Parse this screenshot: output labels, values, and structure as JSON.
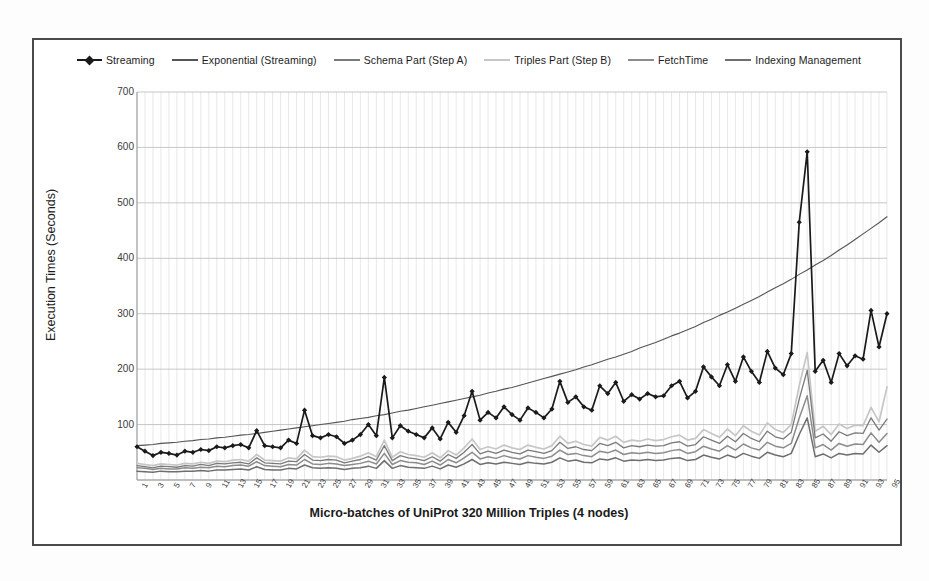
{
  "chart_data": {
    "type": "line",
    "title": "",
    "xlabel": "Micro-batches of UniProt 320 Million Triples (4 nodes)",
    "ylabel": "Execution Times (Seconds)",
    "ylim": [
      0,
      700
    ],
    "ytick_values": [
      0,
      100,
      200,
      300,
      400,
      500,
      600,
      700
    ],
    "ytick_labels": [
      "",
      "100",
      "200",
      "300",
      "400",
      "500",
      "600",
      "700"
    ],
    "xlim": [
      1,
      95
    ],
    "xtick_labels": [
      "1",
      "3",
      "5",
      "7",
      "9",
      "11",
      "13",
      "15",
      "17",
      "19",
      "21",
      "23",
      "25",
      "27",
      "29",
      "31",
      "33",
      "35",
      "37",
      "39",
      "41",
      "43",
      "45",
      "47",
      "49",
      "51",
      "53",
      "55",
      "57",
      "59",
      "61",
      "63",
      "65",
      "67",
      "69",
      "71",
      "73",
      "75",
      "77",
      "79",
      "81",
      "83",
      "85",
      "87",
      "89",
      "91",
      "93",
      "95"
    ],
    "grid": true,
    "legend_position": "top-center",
    "x": [
      1,
      2,
      3,
      4,
      5,
      6,
      7,
      8,
      9,
      10,
      11,
      12,
      13,
      14,
      15,
      16,
      17,
      18,
      19,
      20,
      21,
      22,
      23,
      24,
      25,
      26,
      27,
      28,
      29,
      30,
      31,
      32,
      33,
      34,
      35,
      36,
      37,
      38,
      39,
      40,
      41,
      42,
      43,
      44,
      45,
      46,
      47,
      48,
      49,
      50,
      51,
      52,
      53,
      54,
      55,
      56,
      57,
      58,
      59,
      60,
      61,
      62,
      63,
      64,
      65,
      66,
      67,
      68,
      69,
      70,
      71,
      72,
      73,
      74,
      75,
      76,
      77,
      78,
      79,
      80,
      81,
      82,
      83,
      84,
      85,
      86,
      87,
      88,
      89,
      90,
      91,
      92,
      93,
      94,
      95
    ],
    "series": [
      {
        "name": "Streaming",
        "color": "#1a1a1a",
        "width": 1.7,
        "marker": "diamond",
        "values": [
          60,
          52,
          44,
          50,
          48,
          45,
          52,
          50,
          55,
          53,
          60,
          58,
          62,
          64,
          58,
          89,
          62,
          60,
          58,
          72,
          66,
          126,
          80,
          76,
          82,
          78,
          66,
          72,
          82,
          100,
          80,
          185,
          76,
          98,
          88,
          82,
          76,
          94,
          74,
          104,
          86,
          116,
          160,
          108,
          122,
          112,
          132,
          118,
          108,
          130,
          122,
          112,
          128,
          178,
          140,
          150,
          132,
          126,
          170,
          156,
          176,
          142,
          154,
          146,
          156,
          150,
          152,
          170,
          178,
          148,
          160,
          204,
          186,
          170,
          208,
          178,
          222,
          196,
          176,
          232,
          202,
          190,
          228,
          465,
          592,
          196,
          216,
          176,
          228,
          206,
          224,
          218,
          306,
          240,
          300
        ]
      },
      {
        "name": "Exponential (Streaming)",
        "color": "#555555",
        "width": 1.1,
        "marker": "none",
        "values": [
          62,
          63,
          64,
          66,
          67,
          68,
          70,
          71,
          73,
          74,
          76,
          77,
          79,
          81,
          82,
          84,
          86,
          88,
          90,
          92,
          94,
          96,
          98,
          100,
          102,
          104,
          106,
          109,
          111,
          113,
          116,
          118,
          121,
          124,
          126,
          129,
          132,
          135,
          138,
          141,
          144,
          147,
          150,
          153,
          157,
          160,
          164,
          167,
          171,
          175,
          179,
          183,
          187,
          191,
          195,
          199,
          204,
          208,
          213,
          218,
          222,
          227,
          232,
          238,
          243,
          248,
          254,
          260,
          265,
          271,
          277,
          284,
          290,
          297,
          303,
          310,
          317,
          324,
          331,
          339,
          347,
          354,
          362,
          371,
          379,
          388,
          396,
          405,
          415,
          424,
          434,
          444,
          454,
          464,
          475
        ]
      },
      {
        "name": "Schema Part (Step A)",
        "color": "#7a7a7a",
        "width": 1.3,
        "marker": "none",
        "values": [
          26,
          24,
          22,
          25,
          24,
          23,
          26,
          25,
          28,
          26,
          30,
          29,
          31,
          32,
          29,
          40,
          31,
          30,
          29,
          34,
          33,
          46,
          36,
          35,
          37,
          36,
          31,
          34,
          37,
          42,
          36,
          62,
          35,
          44,
          40,
          38,
          35,
          42,
          34,
          46,
          39,
          50,
          64,
          47,
          52,
          48,
          54,
          50,
          47,
          54,
          51,
          48,
          53,
          68,
          57,
          60,
          55,
          53,
          66,
          62,
          68,
          58,
          62,
          60,
          63,
          61,
          62,
          67,
          69,
          61,
          64,
          78,
          72,
          66,
          79,
          69,
          84,
          75,
          69,
          88,
          78,
          74,
          86,
          146,
          198,
          76,
          83,
          70,
          87,
          80,
          85,
          84,
          112,
          90,
          110
        ]
      },
      {
        "name": "Triples Part (Step B)",
        "color": "#c6c6c6",
        "width": 1.7,
        "marker": "none",
        "values": [
          30,
          28,
          26,
          29,
          28,
          27,
          30,
          29,
          32,
          30,
          34,
          33,
          36,
          37,
          34,
          46,
          36,
          35,
          34,
          40,
          38,
          54,
          42,
          41,
          43,
          42,
          36,
          39,
          43,
          49,
          42,
          72,
          41,
          51,
          46,
          44,
          41,
          49,
          40,
          53,
          45,
          58,
          74,
          55,
          60,
          56,
          63,
          58,
          55,
          63,
          59,
          56,
          62,
          79,
          66,
          70,
          64,
          61,
          77,
          72,
          79,
          68,
          72,
          70,
          74,
          71,
          73,
          78,
          81,
          72,
          75,
          91,
          84,
          77,
          92,
          80,
          98,
          88,
          81,
          103,
          91,
          86,
          100,
          170,
          230,
          88,
          97,
          82,
          101,
          93,
          99,
          98,
          131,
          105,
          168
        ]
      },
      {
        "name": "FetchTime",
        "color": "#8c8c8c",
        "width": 1.5,
        "marker": "none",
        "values": [
          22,
          21,
          19,
          21,
          20,
          20,
          22,
          21,
          23,
          22,
          25,
          24,
          26,
          27,
          25,
          33,
          26,
          25,
          24,
          28,
          27,
          37,
          29,
          28,
          30,
          29,
          26,
          28,
          30,
          34,
          29,
          48,
          28,
          35,
          32,
          31,
          28,
          34,
          27,
          37,
          31,
          40,
          50,
          38,
          42,
          39,
          44,
          40,
          38,
          44,
          41,
          39,
          43,
          54,
          46,
          48,
          44,
          42,
          52,
          49,
          54,
          46,
          49,
          48,
          50,
          48,
          49,
          53,
          55,
          48,
          51,
          61,
          56,
          52,
          62,
          54,
          65,
          58,
          54,
          68,
          61,
          58,
          66,
          112,
          152,
          58,
          64,
          54,
          66,
          61,
          65,
          64,
          85,
          68,
          84
        ]
      },
      {
        "name": "Indexing Management",
        "color": "#6e6e6e",
        "width": 1.5,
        "marker": "none",
        "values": [
          16,
          15,
          14,
          16,
          15,
          15,
          16,
          16,
          17,
          16,
          18,
          18,
          19,
          20,
          18,
          24,
          19,
          18,
          18,
          21,
          20,
          27,
          22,
          21,
          22,
          21,
          19,
          21,
          22,
          25,
          21,
          35,
          21,
          26,
          23,
          22,
          21,
          25,
          20,
          27,
          23,
          29,
          37,
          28,
          31,
          29,
          32,
          30,
          28,
          32,
          30,
          29,
          32,
          40,
          34,
          36,
          32,
          31,
          38,
          36,
          40,
          34,
          36,
          35,
          37,
          35,
          36,
          39,
          40,
          35,
          37,
          45,
          41,
          38,
          45,
          40,
          48,
          43,
          39,
          50,
          45,
          42,
          48,
          82,
          112,
          42,
          47,
          40,
          48,
          45,
          48,
          47,
          63,
          50,
          62
        ]
      }
    ]
  },
  "legend": {
    "items": [
      {
        "label": "Streaming",
        "color": "#1a1a1a",
        "marker": "diamond"
      },
      {
        "label": "Exponential (Streaming)",
        "color": "#555555",
        "marker": "none"
      },
      {
        "label": "Schema Part (Step A)",
        "color": "#7a7a7a",
        "marker": "none"
      },
      {
        "label": "Triples Part (Step B)",
        "color": "#c6c6c6",
        "marker": "none"
      },
      {
        "label": "FetchTime",
        "color": "#8c8c8c",
        "marker": "none"
      },
      {
        "label": "Indexing Management",
        "color": "#6e6e6e",
        "marker": "none"
      }
    ]
  },
  "style": {
    "grid_color": "#d8d8d8",
    "axis_color": "#9a9a9a",
    "frame_color": "#4a4a4a",
    "background": "#ffffff"
  }
}
